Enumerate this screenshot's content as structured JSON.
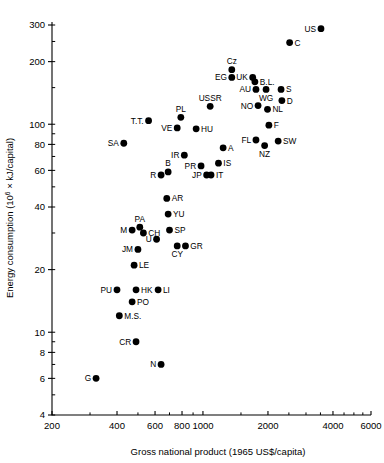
{
  "chart_data": {
    "type": "scatter",
    "title": "",
    "xlabel": "Gross national product (1965 US$/capita)",
    "ylabel": "Energy consumption (10⁶ × kJ/capital)",
    "ylabel_parts": {
      "pre": "Energy consumption (10",
      "exp": "6",
      "post": " × kJ/capital)"
    },
    "xscale": "log",
    "yscale": "log",
    "xlim": [
      200,
      6000
    ],
    "ylim": [
      4,
      330
    ],
    "grid": false,
    "legend": null,
    "xticks": [
      200,
      400,
      600,
      800,
      1000,
      2000,
      4000,
      6000
    ],
    "xticklabels": [
      "200",
      "400",
      "600",
      "800",
      "1000",
      "2000",
      "4000",
      "6000"
    ],
    "yticks": [
      4,
      6,
      8,
      10,
      20,
      40,
      60,
      80,
      100,
      200,
      300
    ],
    "yticklabels": [
      "4",
      "6",
      "8",
      "10",
      "20",
      "40",
      "60",
      "80",
      "100",
      "200",
      "300"
    ],
    "points": [
      {
        "label": "US",
        "x": 3520,
        "y": 288,
        "lp": "left"
      },
      {
        "label": "C",
        "x": 2520,
        "y": 247,
        "lp": "right"
      },
      {
        "label": "Cz",
        "x": 1360,
        "y": 183,
        "lp": "above"
      },
      {
        "label": "EG",
        "x": 1360,
        "y": 168,
        "lp": "left"
      },
      {
        "label": "UK",
        "x": 1700,
        "y": 168,
        "lp": "left"
      },
      {
        "label": "B.L.",
        "x": 1740,
        "y": 160,
        "lp": "right"
      },
      {
        "label": "AU",
        "x": 1760,
        "y": 147,
        "lp": "left"
      },
      {
        "label": "WG",
        "x": 1960,
        "y": 147,
        "lp": "below"
      },
      {
        "label": "S",
        "x": 2300,
        "y": 147,
        "lp": "right"
      },
      {
        "label": "D",
        "x": 2320,
        "y": 130,
        "lp": "right"
      },
      {
        "label": "NO",
        "x": 1800,
        "y": 123,
        "lp": "left"
      },
      {
        "label": "NL",
        "x": 1990,
        "y": 118,
        "lp": "right"
      },
      {
        "label": "USSR",
        "x": 1080,
        "y": 122,
        "lp": "above"
      },
      {
        "label": "T.T.",
        "x": 560,
        "y": 104,
        "lp": "left"
      },
      {
        "label": "PL",
        "x": 790,
        "y": 108,
        "lp": "above"
      },
      {
        "label": "F",
        "x": 2020,
        "y": 99,
        "lp": "right"
      },
      {
        "label": "VE",
        "x": 760,
        "y": 96,
        "lp": "left"
      },
      {
        "label": "HU",
        "x": 930,
        "y": 95,
        "lp": "right"
      },
      {
        "label": "FL",
        "x": 1760,
        "y": 84,
        "lp": "left"
      },
      {
        "label": "SW",
        "x": 2230,
        "y": 83,
        "lp": "right"
      },
      {
        "label": "SA",
        "x": 430,
        "y": 81,
        "lp": "left"
      },
      {
        "label": "NZ",
        "x": 1930,
        "y": 79,
        "lp": "below"
      },
      {
        "label": "A",
        "x": 1240,
        "y": 77,
        "lp": "right"
      },
      {
        "label": "IR",
        "x": 820,
        "y": 71,
        "lp": "left"
      },
      {
        "label": "IS",
        "x": 1180,
        "y": 65,
        "lp": "right"
      },
      {
        "label": "PR",
        "x": 980,
        "y": 63,
        "lp": "left"
      },
      {
        "label": "B",
        "x": 690,
        "y": 59,
        "lp": "above"
      },
      {
        "label": "R",
        "x": 640,
        "y": 57,
        "lp": "left"
      },
      {
        "label": "JP",
        "x": 1040,
        "y": 57,
        "lp": "left"
      },
      {
        "label": "IT",
        "x": 1090,
        "y": 57,
        "lp": "right"
      },
      {
        "label": "AR",
        "x": 680,
        "y": 44,
        "lp": "right"
      },
      {
        "label": "YU",
        "x": 690,
        "y": 37,
        "lp": "right"
      },
      {
        "label": "PA",
        "x": 510,
        "y": 32,
        "lp": "above"
      },
      {
        "label": "M",
        "x": 470,
        "y": 31,
        "lp": "left"
      },
      {
        "label": "CH",
        "x": 530,
        "y": 30,
        "lp": "right"
      },
      {
        "label": "SP",
        "x": 700,
        "y": 31,
        "lp": "right"
      },
      {
        "label": "U",
        "x": 610,
        "y": 28,
        "lp": "left"
      },
      {
        "label": "GR",
        "x": 830,
        "y": 26,
        "lp": "right"
      },
      {
        "label": "CY",
        "x": 760,
        "y": 26,
        "lp": "below"
      },
      {
        "label": "JM",
        "x": 500,
        "y": 25,
        "lp": "left"
      },
      {
        "label": "LE",
        "x": 480,
        "y": 21,
        "lp": "right"
      },
      {
        "label": "PU",
        "x": 400,
        "y": 16,
        "lp": "left"
      },
      {
        "label": "HK",
        "x": 490,
        "y": 16,
        "lp": "right"
      },
      {
        "label": "LI",
        "x": 620,
        "y": 16,
        "lp": "right"
      },
      {
        "label": "PO",
        "x": 470,
        "y": 14,
        "lp": "right"
      },
      {
        "label": "M.S.",
        "x": 410,
        "y": 12,
        "lp": "right"
      },
      {
        "label": "CR",
        "x": 490,
        "y": 9,
        "lp": "left"
      },
      {
        "label": "N",
        "x": 640,
        "y": 7,
        "lp": "left"
      },
      {
        "label": "G",
        "x": 320,
        "y": 6,
        "lp": "left"
      }
    ]
  }
}
